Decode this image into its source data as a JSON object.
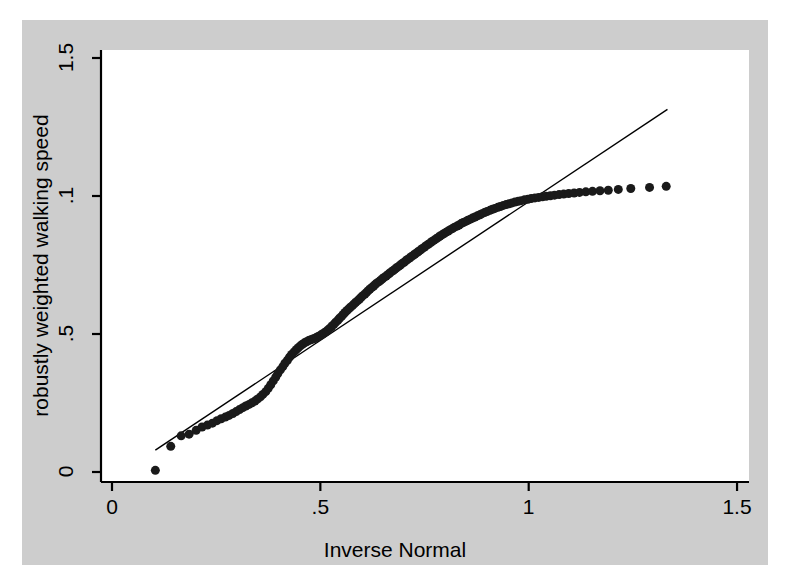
{
  "figure": {
    "background_color": "#ffffff",
    "panel_color": "#cdcdcd",
    "plot_color": "#ffffff",
    "axis_color": "#000000",
    "marker_color": "#1a1a1a",
    "line_color": "#000000"
  },
  "chart_data": {
    "type": "scatter",
    "title": "",
    "subtitle": "",
    "xlabel": "Inverse Normal",
    "ylabel": "robustly weighted walking speed",
    "xlim": [
      0,
      1.5
    ],
    "ylim": [
      0,
      1.5
    ],
    "xticks": [
      0,
      0.5,
      1,
      1.5
    ],
    "xticklabels": [
      "0",
      ".5",
      "1",
      "1.5"
    ],
    "yticks": [
      0,
      0.5,
      1,
      1.5
    ],
    "yticklabels": [
      "0",
      ".5",
      ".1",
      "1.5"
    ],
    "grid": false,
    "legend": null,
    "annotations": [],
    "series": [
      {
        "name": "quantiles",
        "marker": "filled-circle",
        "marker_size": 9,
        "x": [
          0.104,
          0.141,
          0.166,
          0.185,
          0.202,
          0.216,
          0.229,
          0.241,
          0.252,
          0.262,
          0.272,
          0.281,
          0.29,
          0.298,
          0.306,
          0.314,
          0.321,
          0.329,
          0.336,
          0.343,
          0.349,
          0.356,
          0.362,
          0.369,
          0.375,
          0.381,
          0.387,
          0.393,
          0.398,
          0.404,
          0.41,
          0.415,
          0.421,
          0.426,
          0.431,
          0.437,
          0.442,
          0.447,
          0.452,
          0.457,
          0.462,
          0.467,
          0.472,
          0.477,
          0.482,
          0.487,
          0.491,
          0.496,
          0.501,
          0.505,
          0.51,
          0.515,
          0.519,
          0.524,
          0.528,
          0.533,
          0.537,
          0.542,
          0.546,
          0.551,
          0.555,
          0.559,
          0.564,
          0.568,
          0.572,
          0.577,
          0.581,
          0.585,
          0.59,
          0.594,
          0.598,
          0.602,
          0.607,
          0.611,
          0.615,
          0.619,
          0.624,
          0.628,
          0.632,
          0.636,
          0.641,
          0.645,
          0.649,
          0.653,
          0.658,
          0.662,
          0.666,
          0.67,
          0.675,
          0.679,
          0.683,
          0.688,
          0.692,
          0.696,
          0.701,
          0.705,
          0.709,
          0.714,
          0.718,
          0.723,
          0.727,
          0.732,
          0.736,
          0.741,
          0.745,
          0.75,
          0.754,
          0.759,
          0.764,
          0.768,
          0.773,
          0.778,
          0.783,
          0.787,
          0.792,
          0.797,
          0.802,
          0.807,
          0.812,
          0.817,
          0.822,
          0.828,
          0.833,
          0.838,
          0.843,
          0.849,
          0.854,
          0.86,
          0.865,
          0.871,
          0.877,
          0.883,
          0.888,
          0.894,
          0.9,
          0.907,
          0.913,
          0.919,
          0.926,
          0.932,
          0.939,
          0.946,
          0.953,
          0.96,
          0.967,
          0.975,
          0.982,
          0.99,
          0.998,
          1.006,
          1.015,
          1.024,
          1.033,
          1.042,
          1.052,
          1.062,
          1.073,
          1.084,
          1.096,
          1.109,
          1.122,
          1.137,
          1.153,
          1.171,
          1.191,
          1.215,
          1.245,
          1.29,
          1.33
        ],
        "y": [
          0.006,
          0.093,
          0.131,
          0.137,
          0.151,
          0.163,
          0.17,
          0.177,
          0.186,
          0.193,
          0.199,
          0.205,
          0.212,
          0.219,
          0.226,
          0.233,
          0.239,
          0.245,
          0.251,
          0.257,
          0.264,
          0.272,
          0.281,
          0.291,
          0.303,
          0.316,
          0.33,
          0.344,
          0.357,
          0.37,
          0.382,
          0.394,
          0.405,
          0.416,
          0.426,
          0.435,
          0.443,
          0.45,
          0.457,
          0.463,
          0.468,
          0.472,
          0.476,
          0.479,
          0.482,
          0.485,
          0.488,
          0.492,
          0.496,
          0.5,
          0.505,
          0.51,
          0.516,
          0.522,
          0.529,
          0.536,
          0.543,
          0.55,
          0.557,
          0.564,
          0.571,
          0.578,
          0.585,
          0.591,
          0.597,
          0.603,
          0.609,
          0.615,
          0.621,
          0.627,
          0.633,
          0.639,
          0.645,
          0.651,
          0.657,
          0.663,
          0.669,
          0.674,
          0.68,
          0.685,
          0.69,
          0.695,
          0.7,
          0.705,
          0.71,
          0.715,
          0.72,
          0.725,
          0.73,
          0.735,
          0.74,
          0.745,
          0.75,
          0.755,
          0.76,
          0.765,
          0.77,
          0.775,
          0.78,
          0.785,
          0.79,
          0.795,
          0.8,
          0.805,
          0.81,
          0.815,
          0.82,
          0.825,
          0.83,
          0.835,
          0.84,
          0.845,
          0.85,
          0.855,
          0.859,
          0.864,
          0.869,
          0.873,
          0.878,
          0.882,
          0.887,
          0.891,
          0.895,
          0.9,
          0.904,
          0.908,
          0.912,
          0.916,
          0.92,
          0.924,
          0.928,
          0.932,
          0.936,
          0.94,
          0.944,
          0.948,
          0.952,
          0.955,
          0.959,
          0.962,
          0.966,
          0.969,
          0.972,
          0.975,
          0.978,
          0.981,
          0.983,
          0.986,
          0.988,
          0.991,
          0.993,
          0.995,
          0.997,
          0.999,
          1.001,
          1.003,
          1.005,
          1.007,
          1.009,
          1.011,
          1.013,
          1.015,
          1.017,
          1.019,
          1.021,
          1.024,
          1.027,
          1.031,
          1.035
        ]
      }
    ],
    "reference_line": {
      "name": "identity-line",
      "x": [
        0.104,
        1.333
      ],
      "y": [
        0.079,
        1.314
      ]
    }
  }
}
